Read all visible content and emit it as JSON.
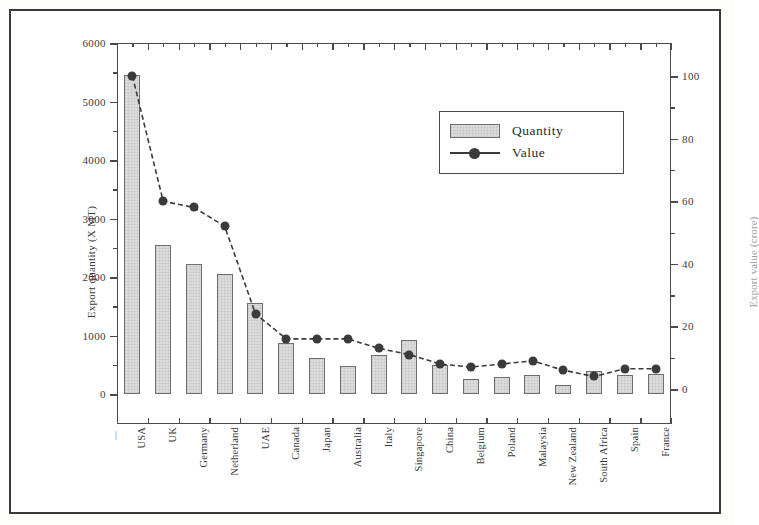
{
  "chart_data": {
    "type": "bar",
    "title": "",
    "xlabel": "",
    "ylabel": "Export quantity (X MT)",
    "y2label": "Export value (crore)",
    "ylim": [
      0,
      6000
    ],
    "y2lim": [
      0,
      100
    ],
    "yticks": [
      "0",
      "1000",
      "2000",
      "3000",
      "4000",
      "5000",
      "6000"
    ],
    "y2ticks": [
      "0",
      "20",
      "40",
      "60",
      "80",
      "100"
    ],
    "grid": false,
    "legend_position": "top-center",
    "categories": [
      "USA",
      "UK",
      "Germany",
      "Netherland",
      "UAE",
      "Canada",
      "Japan",
      "Australia",
      "Italy",
      "Singapore",
      "China",
      "Belgium",
      "Poland",
      "Malaysia",
      "New Zealand",
      "South Africa",
      "Spain",
      "France"
    ],
    "series": [
      {
        "name": "Quantity",
        "axis": "left",
        "type": "bar",
        "color": "#dcdcdc",
        "values": [
          5450,
          2550,
          2230,
          2050,
          1550,
          870,
          620,
          480,
          660,
          920,
          490,
          260,
          290,
          330,
          150,
          390,
          330,
          340
        ]
      },
      {
        "name": "Value",
        "axis": "right",
        "type": "line",
        "color": "#3b3b3b",
        "values": [
          100,
          60,
          58,
          52,
          24,
          16,
          16,
          16,
          13,
          11,
          8,
          7,
          8,
          9,
          6,
          4,
          6.5,
          6.5
        ]
      }
    ]
  },
  "legend": {
    "items": [
      {
        "label": "Quantity",
        "marker": "bar-swatch"
      },
      {
        "label": "Value",
        "marker": "line-dot"
      }
    ]
  },
  "axis_end_caps": {
    "left": "|",
    "right": "|"
  }
}
